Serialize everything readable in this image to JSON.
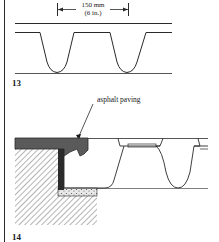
{
  "figure13": {
    "number": "13",
    "dimension_metric": "150 mm",
    "dimension_imperial": "(6 in.)"
  },
  "figure14": {
    "number": "14",
    "callout": "asphalt paving"
  },
  "colors": {
    "line": "#2a2a2a",
    "asphalt": "#555555",
    "hatch": "#6a6a6a",
    "background": "#ffffff"
  }
}
